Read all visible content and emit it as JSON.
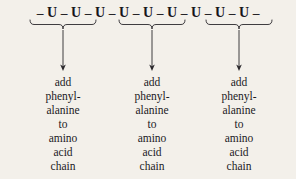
{
  "figure": {
    "background_color": "#f3f0ea",
    "ink_color": "#17161a"
  },
  "rna_strand": {
    "label": "messenger RNA strand of uracil bases",
    "dash": "–",
    "leading_dash": "–",
    "trailing_dash": "–",
    "bases": [
      "U",
      "U",
      "U",
      "U",
      "U",
      "U",
      "U",
      "U",
      "U"
    ],
    "sequence_text": "– U – U – U – U – U – U – U – U – U –"
  },
  "codons": [
    {
      "id": "codon-1",
      "bases": [
        "U",
        "U",
        "U"
      ],
      "brace_label": "underbrace-grouping-codon-1",
      "arrow_label": "down-arrow-codon-1",
      "text_lines": [
        "add",
        "phenyl-",
        "alanine",
        "to",
        "amino",
        "acid",
        "chain"
      ]
    },
    {
      "id": "codon-2",
      "bases": [
        "U",
        "U",
        "U"
      ],
      "brace_label": "underbrace-grouping-codon-2",
      "arrow_label": "down-arrow-codon-2",
      "text_lines": [
        "add",
        "phenyl-",
        "alanine",
        "to",
        "amino",
        "acid",
        "chain"
      ]
    },
    {
      "id": "codon-3",
      "bases": [
        "U",
        "U",
        "U"
      ],
      "brace_label": "underbrace-grouping-codon-3",
      "arrow_label": "down-arrow-codon-3",
      "text_lines": [
        "add",
        "phenyl-",
        "alanine",
        "to",
        "amino",
        "acid",
        "chain"
      ]
    }
  ]
}
